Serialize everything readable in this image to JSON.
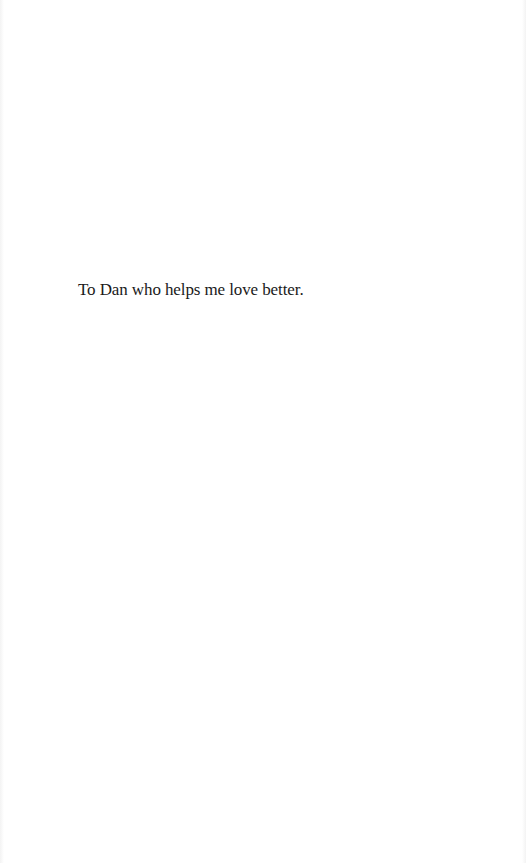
{
  "page": {
    "background_color": "#ffffff",
    "text_color": "#1a1a1a"
  },
  "dedication": {
    "text": "To Dan who helps me love better."
  }
}
